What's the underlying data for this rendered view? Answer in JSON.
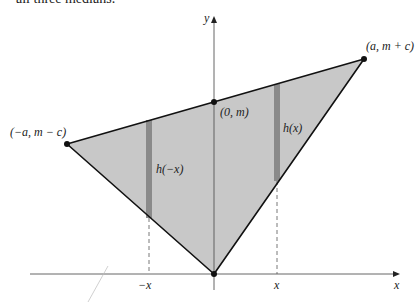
{
  "caption": "all three medians.",
  "axes": {
    "x_label": "x",
    "y_label": "y"
  },
  "colors": {
    "fill": "#c8c8c8",
    "bar": "#8a8a8a",
    "line": "#111111",
    "axis": "#555555"
  },
  "points": [
    {
      "name": "left-vertex",
      "label": "(−a, m − c)",
      "px": [
        67,
        144
      ]
    },
    {
      "name": "top-right-vertex",
      "label": "(a, m + c)",
      "px": [
        364,
        59
      ]
    },
    {
      "name": "y-intercept",
      "label": "(0, m)",
      "px": [
        214,
        102
      ]
    },
    {
      "name": "origin-vertex",
      "label": "",
      "px": [
        214,
        274
      ]
    }
  ],
  "bars": [
    {
      "name": "bar-neg-x",
      "label": "h(−x)",
      "tick": "−x"
    },
    {
      "name": "bar-pos-x",
      "label": "h(x)",
      "tick": "x"
    }
  ]
}
